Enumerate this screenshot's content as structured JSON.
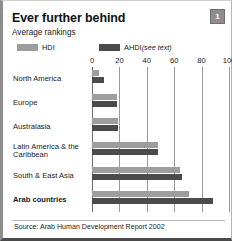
{
  "figure": {
    "badge": "1",
    "title": "Ever further behind",
    "subtitle": "Average rankings",
    "source": "Source: Arab Human Development Report 2002"
  },
  "legend": {
    "items": [
      {
        "label": "HDI",
        "note": "",
        "color": "#9d9d9d"
      },
      {
        "label": "AHDI",
        "note": "(see text)",
        "color": "#4b4b4b"
      }
    ]
  },
  "chart_data": {
    "type": "bar",
    "orientation": "horizontal",
    "title": "Ever further behind",
    "subtitle": "Average rankings",
    "xlabel": "",
    "ylabel": "",
    "xlim": [
      0,
      100
    ],
    "xticks": [
      0,
      20,
      40,
      60,
      80,
      100
    ],
    "grid": true,
    "legend_position": "top",
    "categories": [
      "North America",
      "Europe",
      "Australasia",
      "Latin America & the Caribbean",
      "South & East Asia",
      "Arab countries"
    ],
    "highlight_category": "Arab countries",
    "series": [
      {
        "name": "HDI",
        "color": "#9d9d9d",
        "values": [
          5,
          18,
          19,
          48,
          64,
          71
        ]
      },
      {
        "name": "AHDI",
        "color": "#4b4b4b",
        "values": [
          9,
          18,
          19,
          48,
          66,
          88
        ]
      }
    ],
    "source": "Arab Human Development Report 2002"
  }
}
